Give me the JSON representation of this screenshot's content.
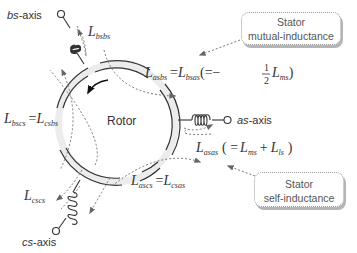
{
  "axes": {
    "as": {
      "prefix": "as",
      "suffix": "-axis"
    },
    "bs": {
      "prefix": "bs",
      "suffix": "-axis"
    },
    "cs": {
      "prefix": "cs",
      "suffix": "-axis"
    }
  },
  "rotor_label": "Rotor",
  "inductances": {
    "L_bsbs": {
      "main": "L",
      "sub": "bsbs"
    },
    "L_csc": {
      "main": "L",
      "sub": "cscs"
    },
    "L_asbs": {
      "main": "L",
      "sub": "asbs",
      "eq": "=",
      "main2": "L",
      "sub2": "bsas",
      "paren_open": "(=−",
      "frac_num": "1",
      "frac_den": "2",
      "main3": "L",
      "sub3": "ms",
      "paren_close": ")"
    },
    "L_bscs": {
      "main": "L",
      "sub": "bscs",
      "eq": "=",
      "main2": "L",
      "sub2": "csbs"
    },
    "L_ascs": {
      "main": "L",
      "sub": "ascs",
      "eq": "=",
      "main2": "L",
      "sub2": "csas"
    },
    "L_asas": {
      "main": "L",
      "sub": "asas",
      "paren_open": "( =",
      "main2": "L",
      "sub2": "ms",
      "plus": "+",
      "main3": "L",
      "sub3": "ls",
      "paren_close": ")"
    }
  },
  "callouts": {
    "mutual": {
      "line1": "Stator",
      "line2": "mutual-inductance"
    },
    "self": {
      "line1": "Stator",
      "line2": "self-inductance"
    }
  },
  "colors": {
    "stroke": "#333333",
    "ring_fill": "#ececec",
    "dashed": "#777777",
    "arrowhead": "#666666",
    "callout_shadow": "#b5b5b5"
  }
}
